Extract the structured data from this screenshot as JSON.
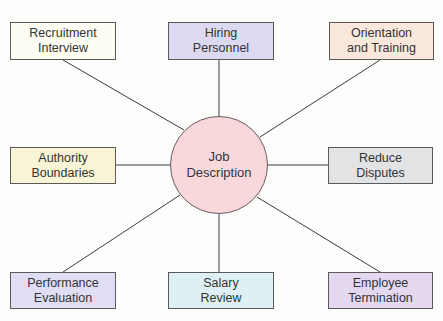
{
  "diagram": {
    "type": "hub-and-spoke",
    "center": {
      "label": "Job\nDescription",
      "fill": "#f8d8da",
      "cx": 219,
      "cy": 165,
      "r": 49
    },
    "nodes": [
      {
        "id": "recruitment-interview",
        "label": "Recruitment\nInterview",
        "fill": "#fdfdf4",
        "x": 10,
        "y": 22,
        "w": 106,
        "h": 38
      },
      {
        "id": "hiring-personnel",
        "label": "Hiring\nPersonnel",
        "fill": "#dcdaf2",
        "x": 168,
        "y": 22,
        "w": 106,
        "h": 38
      },
      {
        "id": "orientation-and-training",
        "label": "Orientation\nand Training",
        "fill": "#fae8dc",
        "x": 329,
        "y": 22,
        "w": 105,
        "h": 38
      },
      {
        "id": "authority-boundaries",
        "label": "Authority\nBoundaries",
        "fill": "#f8f5d6",
        "x": 10,
        "y": 147,
        "w": 106,
        "h": 37
      },
      {
        "id": "reduce-disputes",
        "label": "Reduce\nDisputes",
        "fill": "#e2e3e5",
        "x": 328,
        "y": 147,
        "w": 105,
        "h": 37
      },
      {
        "id": "performance-evaluation",
        "label": "Performance\nEvaluation",
        "fill": "#e0def4",
        "x": 10,
        "y": 272,
        "w": 106,
        "h": 37
      },
      {
        "id": "salary-review",
        "label": "Salary\nReview",
        "fill": "#def0f4",
        "x": 168,
        "y": 272,
        "w": 106,
        "h": 37
      },
      {
        "id": "employee-termination",
        "label": "Employee\nTermination",
        "fill": "#e4d8f0",
        "x": 328,
        "y": 272,
        "w": 105,
        "h": 37
      }
    ],
    "connectors": [
      {
        "to": "recruitment-interview",
        "x1": 63,
        "y1": 60,
        "x2": 184,
        "y2": 130
      },
      {
        "to": "hiring-personnel",
        "x1": 219,
        "y1": 60,
        "x2": 219,
        "y2": 116
      },
      {
        "to": "orientation-and-training",
        "x1": 380,
        "y1": 60,
        "x2": 260,
        "y2": 137
      },
      {
        "to": "authority-boundaries",
        "x1": 116,
        "y1": 165,
        "x2": 170,
        "y2": 165
      },
      {
        "to": "reduce-disputes",
        "x1": 268,
        "y1": 165,
        "x2": 328,
        "y2": 165
      },
      {
        "to": "performance-evaluation",
        "x1": 63,
        "y1": 272,
        "x2": 180,
        "y2": 195
      },
      {
        "to": "salary-review",
        "x1": 219,
        "y1": 214,
        "x2": 219,
        "y2": 272
      },
      {
        "to": "employee-termination",
        "x1": 380,
        "y1": 272,
        "x2": 257,
        "y2": 197
      }
    ],
    "line_color": "#3c3c3c",
    "border_color": "#5a5a5a"
  }
}
